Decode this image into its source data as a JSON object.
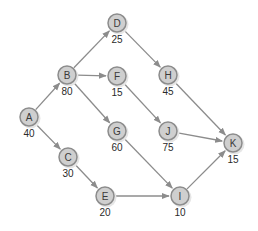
{
  "diagram": {
    "type": "network",
    "colors": {
      "node_fill": "#cfcfcf",
      "node_stroke": "#8c8c8c",
      "edge": "#8c8c8c",
      "text": "#2a2a2a"
    },
    "nodes": [
      {
        "id": "A",
        "label": "A",
        "value": "40",
        "x": 29,
        "y": 117
      },
      {
        "id": "B",
        "label": "B",
        "value": "80",
        "x": 67,
        "y": 75
      },
      {
        "id": "C",
        "label": "C",
        "value": "30",
        "x": 68,
        "y": 157
      },
      {
        "id": "D",
        "label": "D",
        "value": "25",
        "x": 117,
        "y": 23
      },
      {
        "id": "E",
        "label": "E",
        "value": "20",
        "x": 105,
        "y": 196
      },
      {
        "id": "F",
        "label": "F",
        "value": "15",
        "x": 117,
        "y": 76
      },
      {
        "id": "G",
        "label": "G",
        "value": "60",
        "x": 117,
        "y": 131
      },
      {
        "id": "H",
        "label": "H",
        "value": "45",
        "x": 168,
        "y": 75
      },
      {
        "id": "I",
        "label": "I",
        "value": "10",
        "x": 180,
        "y": 196
      },
      {
        "id": "J",
        "label": "J",
        "value": "75",
        "x": 168,
        "y": 131
      },
      {
        "id": "K",
        "label": "K",
        "value": "15",
        "x": 233,
        "y": 143
      }
    ],
    "edges": [
      {
        "from": "A",
        "to": "B"
      },
      {
        "from": "A",
        "to": "C"
      },
      {
        "from": "B",
        "to": "D"
      },
      {
        "from": "B",
        "to": "F"
      },
      {
        "from": "B",
        "to": "G"
      },
      {
        "from": "C",
        "to": "E"
      },
      {
        "from": "D",
        "to": "H"
      },
      {
        "from": "F",
        "to": "J"
      },
      {
        "from": "G",
        "to": "I"
      },
      {
        "from": "E",
        "to": "I"
      },
      {
        "from": "H",
        "to": "K"
      },
      {
        "from": "J",
        "to": "K"
      },
      {
        "from": "I",
        "to": "K"
      }
    ]
  }
}
